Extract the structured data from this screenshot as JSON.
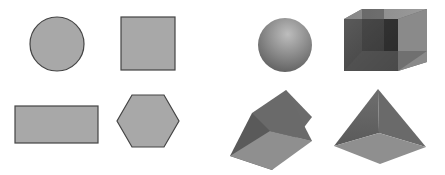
{
  "figure": {
    "panels": [
      {
        "name": "2d-shapes",
        "shapes": [
          {
            "name": "circle",
            "fill": "#a8a8a8",
            "stroke": "#444444"
          },
          {
            "name": "square",
            "fill": "#a8a8a8",
            "stroke": "#444444"
          },
          {
            "name": "rectangle",
            "fill": "#a8a8a8",
            "stroke": "#444444"
          },
          {
            "name": "hexagon",
            "fill": "#a8a8a8",
            "stroke": "#444444"
          }
        ]
      },
      {
        "name": "3d-solids",
        "shapes": [
          {
            "name": "sphere"
          },
          {
            "name": "rectangular-prism"
          },
          {
            "name": "triangular-prism"
          },
          {
            "name": "square-pyramid"
          }
        ]
      }
    ]
  },
  "colors": {
    "background": "#ffffff",
    "flat_fill": "#a8a8a8",
    "flat_stroke": "#444444",
    "solid_light": "#9a9a9a",
    "solid_mid": "#7a7a7a",
    "solid_dark": "#4a4a4a"
  }
}
